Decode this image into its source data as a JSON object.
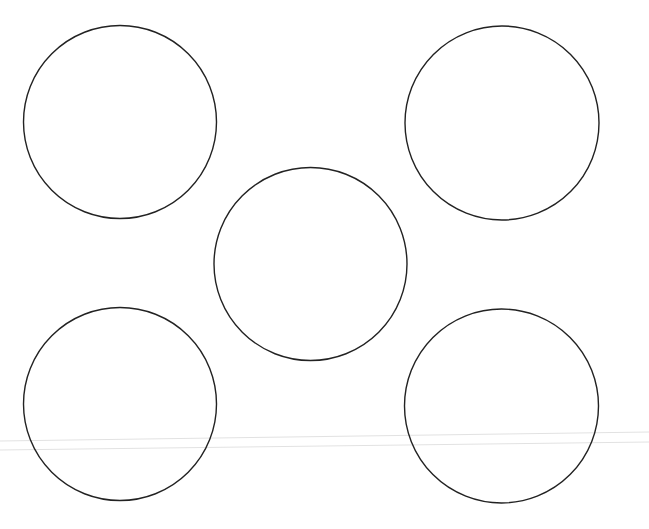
{
  "canvas": {
    "width": 649,
    "height": 529,
    "background": "#ffffff"
  },
  "style": {
    "stroke_color": "#222222",
    "stroke_width": 1.4,
    "fill": "none",
    "guide_line_color": "#e2e2e2"
  },
  "circles": [
    {
      "id": "top-left",
      "cx": 120,
      "cy": 122,
      "r": 96.5
    },
    {
      "id": "top-right",
      "cx": 502,
      "cy": 123,
      "r": 97
    },
    {
      "id": "center",
      "cx": 310.5,
      "cy": 264,
      "r": 96.5
    },
    {
      "id": "bottom-left",
      "cx": 120,
      "cy": 404,
      "r": 96.5
    },
    {
      "id": "bottom-right",
      "cx": 501.5,
      "cy": 406,
      "r": 97
    }
  ],
  "guide_lines": [
    {
      "x1": 0,
      "y1": 441,
      "x2": 649,
      "y2": 432
    },
    {
      "x1": 0,
      "y1": 450,
      "x2": 649,
      "y2": 442
    }
  ]
}
